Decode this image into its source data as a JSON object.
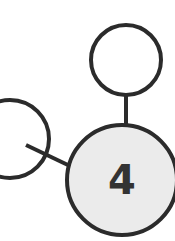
{
  "diagram": {
    "type": "tree-fragment",
    "nodes": [
      {
        "id": "center",
        "label": "4",
        "fill": "#ebebeb",
        "highlighted": true
      },
      {
        "id": "top",
        "label": "",
        "fill": "#ffffff"
      },
      {
        "id": "left",
        "label": "",
        "fill": "#ffffff",
        "partially_visible": true
      }
    ],
    "edges": [
      {
        "from": "center",
        "to": "top"
      },
      {
        "from": "center",
        "to": "left"
      }
    ],
    "colors": {
      "stroke": "#2b2b2b",
      "center_fill": "#ebebeb",
      "node_fill": "#ffffff"
    }
  }
}
